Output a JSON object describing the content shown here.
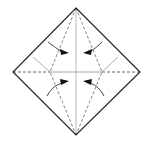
{
  "diagram": {
    "type": "origami-fold-diagram",
    "colors": {
      "outline": "#222222",
      "dashed_fold": "#777777",
      "crease": "#aaaaaa",
      "arrow": "#111111",
      "background": "#ffffff"
    },
    "vertices": {
      "top": [
        76,
        8
      ],
      "right": [
        140,
        72
      ],
      "bottom": [
        76,
        135
      ],
      "left": [
        13,
        72
      ]
    },
    "arrows": [
      {
        "position": "upper-left",
        "direction": "right"
      },
      {
        "position": "upper-right",
        "direction": "left"
      },
      {
        "position": "lower-left",
        "direction": "right"
      },
      {
        "position": "lower-right",
        "direction": "left"
      }
    ]
  }
}
